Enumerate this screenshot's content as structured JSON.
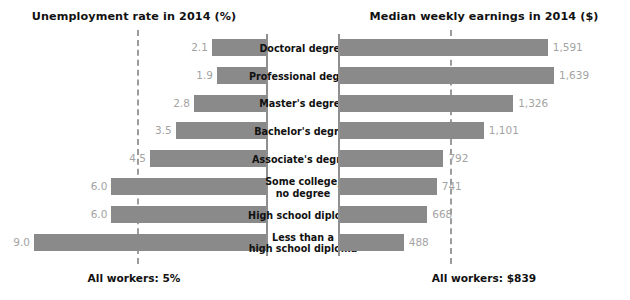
{
  "left_panel": {
    "title": "Unemployment rate in 2014 (%)",
    "footer": "All workers: 5%"
  },
  "right_panel": {
    "title": "Median weekly earnings in 2014 ($)",
    "footer": "All workers: $839"
  },
  "categories": [
    {
      "line1": "Doctoral degree",
      "line2": ""
    },
    {
      "line1": "Professional degree",
      "line2": ""
    },
    {
      "line1": "Master's degree",
      "line2": ""
    },
    {
      "line1": "Bachelor's degree",
      "line2": ""
    },
    {
      "line1": "Associate's degree",
      "line2": ""
    },
    {
      "line1": "Some college,",
      "line2": "no degree"
    },
    {
      "line1": "High school diploma",
      "line2": ""
    },
    {
      "line1": "Less than a",
      "line2": "high school diploma"
    }
  ],
  "labels": {
    "unemployment": [
      "2.1",
      "1.9",
      "2.8",
      "3.5",
      "4.5",
      "6.0",
      "6.0",
      "9.0"
    ],
    "earnings": [
      "1,591",
      "1,639",
      "1,326",
      "1,101",
      "792",
      "741",
      "668",
      "488"
    ]
  },
  "colors": {
    "bar": "#8a8a8a",
    "value_text": "#a3a3a3",
    "axis": "#8f8f8f",
    "reference_line": "#9c9c9c",
    "heading_text": "#111111",
    "background": "#ffffff"
  },
  "chart_data": [
    {
      "type": "bar",
      "orientation": "horizontal-left",
      "title": "Unemployment rate in 2014 (%)",
      "xlabel": "",
      "ylabel": "",
      "categories": [
        "Doctoral degree",
        "Professional degree",
        "Master's degree",
        "Bachelor's degree",
        "Associate's degree",
        "Some college, no degree",
        "High school diploma",
        "Less than a high school diploma"
      ],
      "values": [
        2.1,
        1.9,
        2.8,
        3.5,
        4.5,
        6.0,
        6.0,
        9.0
      ],
      "value_labels": [
        "2.1",
        "1.9",
        "2.8",
        "3.5",
        "4.5",
        "6.0",
        "6.0",
        "9.0"
      ],
      "xlim": [
        0,
        9.0
      ],
      "grid": false,
      "legend": "none",
      "reference_line": {
        "label": "All workers: 5%",
        "value": 5.0
      }
    },
    {
      "type": "bar",
      "orientation": "horizontal-right",
      "title": "Median weekly earnings in 2014 ($)",
      "xlabel": "",
      "ylabel": "",
      "categories": [
        "Doctoral degree",
        "Professional degree",
        "Master's degree",
        "Bachelor's degree",
        "Associate's degree",
        "Some college, no degree",
        "High school diploma",
        "Less than a high school diploma"
      ],
      "values": [
        1591,
        1639,
        1326,
        1101,
        792,
        741,
        668,
        488
      ],
      "value_labels": [
        "1,591",
        "1,639",
        "1,326",
        "1,101",
        "792",
        "741",
        "668",
        "488"
      ],
      "xlim": [
        0,
        1639
      ],
      "grid": false,
      "legend": "none",
      "reference_line": {
        "label": "All workers: $839",
        "value": 839
      }
    }
  ]
}
